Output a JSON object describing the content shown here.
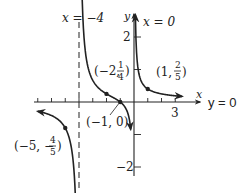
{
  "chart_data": {
    "type": "line",
    "title": "",
    "function": "f(x) = (x+1) / (x(x+4))",
    "xlabel": "x",
    "ylabel": "y",
    "xlim": [
      -7.2,
      4.3
    ],
    "ylim": [
      -2.5,
      2.7
    ],
    "x_ticks": [
      -7,
      -6,
      -5,
      -4,
      -3,
      -2,
      -1,
      1,
      2,
      3
    ],
    "x_tick_labels": [
      {
        "x": 3,
        "label": "3"
      }
    ],
    "y_ticks": [
      -2,
      -1,
      1,
      2
    ],
    "y_tick_labels": [
      {
        "y": 2,
        "label": "2"
      },
      {
        "y": -2,
        "label": "−2"
      }
    ],
    "asymptotes": {
      "vertical": [
        {
          "x": -4,
          "label": "x = −4",
          "style": "dashed"
        },
        {
          "x": 0,
          "label": "x = 0",
          "style": "axis"
        }
      ],
      "horizontal": [
        {
          "y": 0,
          "label": "y = 0"
        }
      ]
    },
    "branches": [
      {
        "name": "left",
        "domain": [
          -7.0,
          -4.12
        ]
      },
      {
        "name": "middle",
        "domain": [
          -3.86,
          -0.24
        ]
      },
      {
        "name": "right",
        "domain": [
          0.1,
          3.5
        ]
      }
    ],
    "labeled_points": [
      {
        "x": -2,
        "y": 0.25,
        "label_main": "(−2, ",
        "frac_num": "1",
        "frac_den": "4",
        "label_end": ")"
      },
      {
        "x": 1,
        "y": 0.4,
        "label_main": "(1, ",
        "frac_num": "2",
        "frac_den": "5",
        "label_end": ")"
      },
      {
        "x": -1,
        "y": 0,
        "label_main": "(−1, 0)"
      },
      {
        "x": -5,
        "y": -0.8,
        "label_main": "(−5, −",
        "frac_num": "4",
        "frac_den": "5",
        "label_end": ")"
      }
    ]
  },
  "labels": {
    "asym_x_neg4": "x = −4",
    "asym_x_0": "x = 0",
    "asym_y_0": "y = 0",
    "axis_x": "x",
    "axis_y": "y",
    "tick_3": "3",
    "tick_2": "2",
    "tick_neg2": "−2",
    "pt_neg2_main": "(−2, ",
    "pt_neg2_num": "1",
    "pt_neg2_den": "4",
    "pt_neg2_end": ")",
    "pt_1_main": "(1, ",
    "pt_1_num": "2",
    "pt_1_den": "5",
    "pt_1_end": ")",
    "pt_neg1": "(−1, 0)",
    "pt_neg5_main": "(−5, −",
    "pt_neg5_num": "4",
    "pt_neg5_den": "5",
    "pt_neg5_end": ")"
  },
  "colors": {
    "ink": "#222222",
    "background": "#ffffff"
  }
}
